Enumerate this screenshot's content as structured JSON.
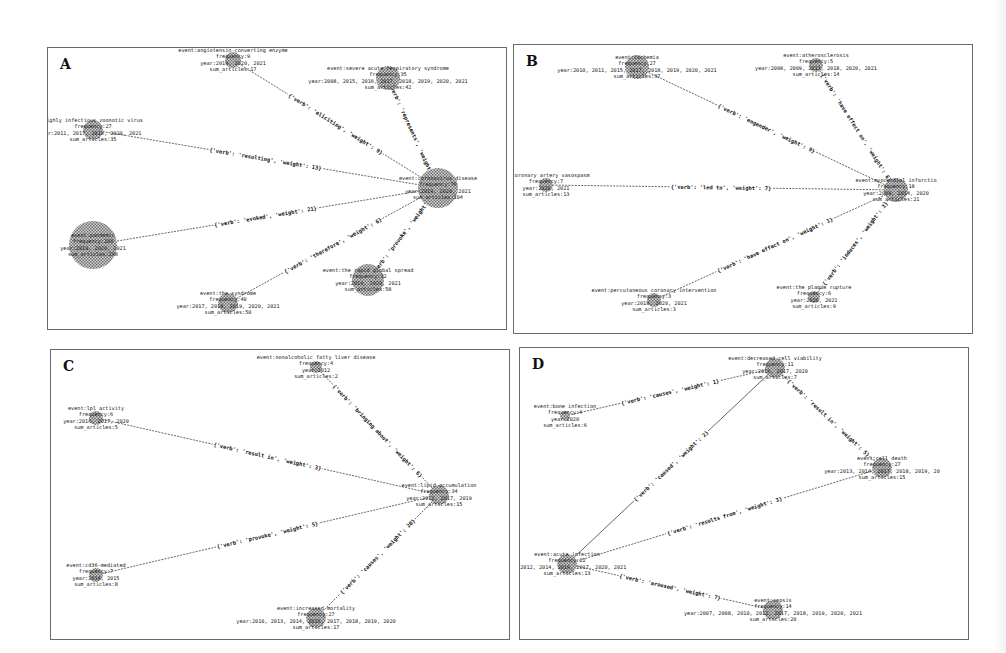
{
  "figure": {
    "panels": [
      {
        "id": "A",
        "letter": "A",
        "box": {
          "x": 47,
          "y": 47,
          "w": 460,
          "h": 283
        },
        "nodes": [
          {
            "key": "center",
            "x": 390,
            "y": 140,
            "r": 20,
            "lines": [
              "event:coronavirus disease",
              "frequency:76",
              "year:2019, 2020, 2021",
              "sum_articles:104"
            ]
          },
          {
            "key": "ace",
            "x": 185,
            "y": 12,
            "r": 8,
            "lines": [
              "event:angiotensin-converting enzyme",
              "frequency:9",
              "year:2019, 2020, 2021",
              "sum_articles:17"
            ]
          },
          {
            "key": "sars",
            "x": 340,
            "y": 30,
            "r": 12,
            "lines": [
              "event:severe acute respiratory syndrome",
              "frequency:35",
              "year:2008, 2015, 2016, 2017, 2018, 2019, 2020, 2021",
              "sum_articles:42"
            ]
          },
          {
            "key": "virus",
            "x": 45,
            "y": 82,
            "r": 10,
            "lines": [
              "highly infectious zoonotic virus",
              "frequency:27",
              "ar:2011, 2017, 2019, 2020, 2021",
              "sum_articles:35"
            ]
          },
          {
            "key": "pandemic",
            "x": 45,
            "y": 197,
            "r": 24,
            "lines": [
              "event:pandemic",
              "frequency:200",
              "year:2019, 2020, 2021",
              "sum_articles:298"
            ]
          },
          {
            "key": "syndrome",
            "x": 180,
            "y": 255,
            "r": 10,
            "lines": [
              "event:the syndrome",
              "frequency:40",
              "year:2017, 2018, 2019, 2020, 2021",
              "sum_articles:50"
            ]
          },
          {
            "key": "spread",
            "x": 320,
            "y": 232,
            "r": 16,
            "lines": [
              "event:the rapid global spread",
              "frequency:32",
              "year:2019, 2020, 2021",
              "sum_articles:58"
            ]
          }
        ],
        "edges": [
          {
            "from": "ace",
            "to": "center",
            "label": "{'verb': 'eliciting', 'weight': 9}"
          },
          {
            "from": "sars",
            "to": "center",
            "label": "{'verb': 'represents', 'weight': 7}"
          },
          {
            "from": "virus",
            "to": "center",
            "label": "{'verb': 'resulting', 'weight': 13}"
          },
          {
            "from": "center",
            "to": "pandemic",
            "label": "{'verb': 'evoked', 'weight': 21}"
          },
          {
            "from": "syndrome",
            "to": "center",
            "label": "{'verb': 'therefore', 'weight': 6}"
          },
          {
            "from": "spread",
            "to": "center",
            "label": "{'verb': 'provoke', 'weight': 8}"
          }
        ]
      },
      {
        "id": "B",
        "letter": "B",
        "box": {
          "x": 513,
          "y": 44,
          "w": 460,
          "h": 290
        },
        "nodes": [
          {
            "key": "center",
            "x": 382,
            "y": 145,
            "r": 12,
            "lines": [
              "event:myocardial infarctio",
              "frequency:18",
              "year:2009, 2014, 2020",
              "sum_articles:21"
            ]
          },
          {
            "key": "ischemia",
            "x": 123,
            "y": 22,
            "r": 12,
            "lines": [
              "event:ischemia",
              "frequency:27",
              "year:2010, 2011, 2015, 2017, 2018, 2019, 2020, 2021",
              "sum_articles:37"
            ]
          },
          {
            "key": "athero",
            "x": 302,
            "y": 20,
            "r": 7,
            "lines": [
              "event:atherosclerosis",
              "frequency:5",
              "year:2008, 2009, 2013, 2018, 2020, 2021",
              "sum_articles:14"
            ]
          },
          {
            "key": "vasospasm",
            "x": 32,
            "y": 140,
            "r": 7,
            "lines": [
              "nt:coronary artery vasospasm",
              "frequency:7",
              "year:2020, 2021",
              "sum_articles:13"
            ]
          },
          {
            "key": "pci",
            "x": 140,
            "y": 255,
            "r": 7,
            "lines": [
              "event:percutaneous coronary intervention",
              "frequency:3",
              "year:2018, 2020, 2021",
              "sum_articles:3"
            ]
          },
          {
            "key": "plaque",
            "x": 300,
            "y": 252,
            "r": 6,
            "lines": [
              "event:the plaque rupture",
              "frequency:6",
              "year:2020, 2021",
              "sum_articles:9"
            ]
          }
        ],
        "edges": [
          {
            "from": "ischemia",
            "to": "center",
            "label": "{'verb': 'engender', 'weight': 9}"
          },
          {
            "from": "athero",
            "to": "center",
            "label": "{'verb': 'have effect on', 'weight': 6}"
          },
          {
            "from": "vasospasm",
            "to": "center",
            "label": "{'verb': 'led to', 'weight': 7}"
          },
          {
            "from": "pci",
            "to": "center",
            "label": "{'verb': 'have effect on', 'weight': 1}"
          },
          {
            "from": "plaque",
            "to": "center",
            "label": "{'verb': 'induces', 'weight': 3}"
          }
        ]
      },
      {
        "id": "C",
        "letter": "C",
        "box": {
          "x": 50,
          "y": 349,
          "w": 460,
          "h": 291
        },
        "nodes": [
          {
            "key": "center",
            "x": 388,
            "y": 145,
            "r": 10,
            "lines": [
              "event:lipid accumulation",
              "frequency:34",
              "year:2012, 2017, 2019",
              "sum_articles:15"
            ]
          },
          {
            "key": "nafld",
            "x": 265,
            "y": 17,
            "r": 6,
            "lines": [
              "event:nonalcoholic fatty liver disease",
              "frequency:4",
              "year:2012",
              "sum_articles:2"
            ]
          },
          {
            "key": "lpl",
            "x": 45,
            "y": 68,
            "r": 7,
            "lines": [
              "event:lpl activity",
              "frequency:6",
              "year:2016, 2017, 2020",
              "sum_articles:5"
            ]
          },
          {
            "key": "cd36",
            "x": 45,
            "y": 225,
            "r": 7,
            "lines": [
              "event:cd36-mediated",
              "frequency:7",
              "year:2014, 2015",
              "sum_articles:8"
            ]
          },
          {
            "key": "mortality",
            "x": 265,
            "y": 268,
            "r": 10,
            "lines": [
              "event:increased mortality",
              "frequency:27",
              "year:2010, 2013, 2014, 2016, 2017, 2018, 2019, 2020",
              "sum_articles:17"
            ]
          }
        ],
        "edges": [
          {
            "from": "nafld",
            "to": "center",
            "label": "{'verb': 'bringing about', 'weight': 6}"
          },
          {
            "from": "lpl",
            "to": "center",
            "label": "{'verb': 'result in', 'weight': 3}"
          },
          {
            "from": "cd36",
            "to": "center",
            "label": "{'verb': 'provoke', 'weight': 5}"
          },
          {
            "from": "center",
            "to": "mortality",
            "label": "{'verb': 'causes', 'weight': 20}"
          }
        ]
      },
      {
        "id": "D",
        "letter": "D",
        "box": {
          "x": 519,
          "y": 347,
          "w": 450,
          "h": 293
        },
        "nodes": [
          {
            "key": "cellviab",
            "x": 255,
            "y": 20,
            "r": 10,
            "lines": [
              "event:decreased cell viability",
              "frequency:11",
              "year:2016, 2017, 2020",
              "sum_articles:7"
            ]
          },
          {
            "key": "bone",
            "x": 45,
            "y": 68,
            "r": 5,
            "lines": [
              "event:bone infection",
              "frequency:4",
              "year:2020",
              "sum_articles:6"
            ]
          },
          {
            "key": "celldeath",
            "x": 362,
            "y": 120,
            "r": 10,
            "lines": [
              "event:cell death",
              "frequency:27",
              "year:2013, 2014, 2017, 2018, 2019, 20",
              "sum_articles:15"
            ]
          },
          {
            "key": "acute",
            "x": 47,
            "y": 216,
            "r": 10,
            "lines": [
              "event:acute infection",
              "frequency:22",
              "11, 2012, 2014, 2016, 2017, 2020, 2021",
              "sum_articles:13"
            ]
          },
          {
            "key": "sepsis",
            "x": 253,
            "y": 262,
            "r": 10,
            "lines": [
              "event:sepsis",
              "frequency:14",
              "year:2007, 2008, 2010, 2012, 2017, 2018, 2019, 2020, 2021",
              "sum_articles:20"
            ]
          }
        ],
        "edges": [
          {
            "from": "bone",
            "to": "cellviab",
            "label": "{'verb': 'causes', 'weight': 1}"
          },
          {
            "from": "acute",
            "to": "cellviab",
            "label": "{'verb': 'caused', 'weight': 2}",
            "solid": true
          },
          {
            "from": "cellviab",
            "to": "celldeath",
            "label": "{'verb': 'result in', 'weight': 5}"
          },
          {
            "from": "acute",
            "to": "celldeath",
            "label": "{'verb': 'results from', 'weight': 3}"
          },
          {
            "from": "acute",
            "to": "sepsis",
            "label": "{'verb': 'aroused', 'weight': 7}"
          }
        ]
      }
    ]
  }
}
